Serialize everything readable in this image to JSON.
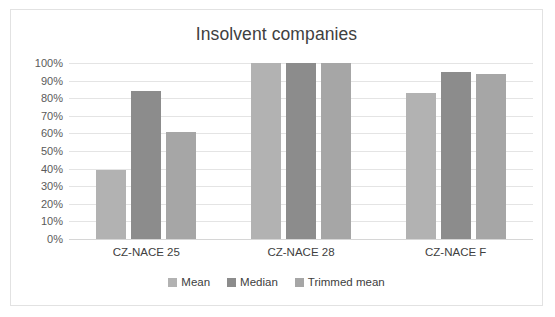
{
  "chart_data": {
    "type": "bar",
    "title": "Insolvent companies",
    "xlabel": "",
    "ylabel": "",
    "categories": [
      "CZ-NACE 25",
      "CZ-NACE 28",
      "CZ-NACE F"
    ],
    "series": [
      {
        "name": "Mean",
        "color": "#b2b2b2",
        "values": [
          39,
          100,
          83
        ]
      },
      {
        "name": "Median",
        "color": "#8c8c8c",
        "values": [
          84,
          100,
          95
        ]
      },
      {
        "name": "Trimmed mean",
        "color": "#a6a6a6",
        "values": [
          61,
          100,
          94
        ]
      }
    ],
    "ylim": [
      0,
      100
    ],
    "y_ticks": [
      "100%",
      "90%",
      "80%",
      "70%",
      "60%",
      "50%",
      "40%",
      "30%",
      "20%",
      "10%",
      "0%"
    ],
    "y_tick_values": [
      100,
      90,
      80,
      70,
      60,
      50,
      40,
      30,
      20,
      10,
      0
    ],
    "value_suffix": "%",
    "grid": "horizontal",
    "legend_position": "bottom",
    "plot_background": "#ffffff",
    "gridline_color": "#e4e4e4",
    "border_color": "#e2e2e2",
    "text_color": "#404040"
  }
}
